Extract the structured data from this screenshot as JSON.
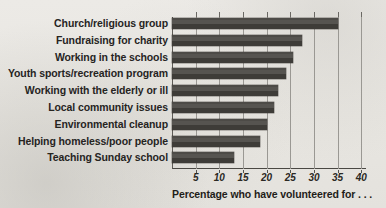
{
  "chart_data": {
    "type": "bar",
    "orientation": "horizontal",
    "title": "",
    "subtitle": "",
    "xlabel": "Percentage who have volunteered for . . .",
    "ylabel": "",
    "xlim": [
      0,
      41
    ],
    "grid": true,
    "legend": false,
    "xticks": [
      5,
      10,
      15,
      20,
      25,
      30,
      35,
      40
    ],
    "xtick_labels": [
      "5",
      "10",
      "15",
      "20",
      "25",
      "30",
      "35",
      "40"
    ],
    "categories": [
      "Church/religious group",
      "Fundraising for charity",
      "Working in the schools",
      "Youth sports/recreation program",
      "Working with the elderly or ill",
      "Local community issues",
      "Environmental cleanup",
      "Helping homeless/poor people",
      "Teaching Sunday school"
    ],
    "values": [
      35,
      27.5,
      25.5,
      24,
      22.5,
      21.5,
      20,
      18.5,
      13
    ],
    "bar_color": "#4d4b47",
    "background_color": "#eae8e4"
  },
  "caption": "Percentage who have volunteered for . . ."
}
